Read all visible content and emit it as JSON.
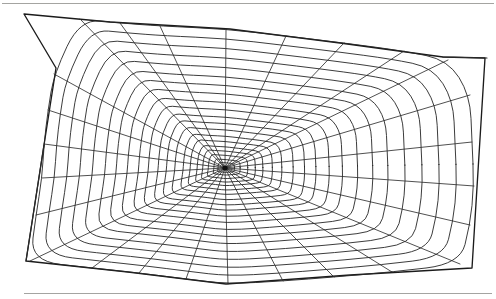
{
  "figure": {
    "caption": "",
    "background_color": "#ffffff",
    "line_color": "#222222",
    "rule_color": "#9a9a96"
  },
  "rules": [
    {
      "name": "top-rule",
      "y": 3.5,
      "x1": 2,
      "x2": 494
    },
    {
      "name": "bottom-rule",
      "y": 293.5,
      "x1": 24,
      "x2": 492
    }
  ],
  "chart_data": {
    "type": "scatter",
    "xlabel": "",
    "ylabel": "",
    "hub": {
      "x": 225,
      "y": 168
    },
    "frame_vertices": [
      {
        "x": 24,
        "y": 14
      },
      {
        "x": 110,
        "y": 22
      },
      {
        "x": 230,
        "y": 29
      },
      {
        "x": 340,
        "y": 43
      },
      {
        "x": 443,
        "y": 57
      },
      {
        "x": 485,
        "y": 58
      },
      {
        "x": 472,
        "y": 268
      },
      {
        "x": 350,
        "y": 275
      },
      {
        "x": 226,
        "y": 284
      },
      {
        "x": 128,
        "y": 272
      },
      {
        "x": 26,
        "y": 261
      },
      {
        "x": 44,
        "y": 145
      },
      {
        "x": 56,
        "y": 68
      }
    ],
    "radii_count": 26,
    "spiral_turns": 20,
    "radius_endpoints": [
      {
        "angle_deg": 0,
        "x": 474,
        "y": 186
      },
      {
        "angle_deg": 14,
        "x": 470,
        "y": 225
      },
      {
        "angle_deg": 28,
        "x": 460,
        "y": 264
      },
      {
        "angle_deg": 42,
        "x": 392,
        "y": 272
      },
      {
        "angle_deg": 56,
        "x": 334,
        "y": 277
      },
      {
        "angle_deg": 70,
        "x": 283,
        "y": 281
      },
      {
        "angle_deg": 84,
        "x": 228,
        "y": 284
      },
      {
        "angle_deg": 98,
        "x": 186,
        "y": 279
      },
      {
        "angle_deg": 112,
        "x": 139,
        "y": 273
      },
      {
        "angle_deg": 126,
        "x": 92,
        "y": 268
      },
      {
        "angle_deg": 140,
        "x": 30,
        "y": 261
      },
      {
        "angle_deg": 154,
        "x": 36,
        "y": 215
      },
      {
        "angle_deg": 168,
        "x": 42,
        "y": 178
      },
      {
        "angle_deg": 180,
        "x": 44,
        "y": 144
      },
      {
        "angle_deg": 194,
        "x": 48,
        "y": 110
      },
      {
        "angle_deg": 208,
        "x": 54,
        "y": 74
      },
      {
        "angle_deg": 222,
        "x": 80,
        "y": 19
      },
      {
        "angle_deg": 236,
        "x": 120,
        "y": 23
      },
      {
        "angle_deg": 250,
        "x": 160,
        "y": 26
      },
      {
        "angle_deg": 264,
        "x": 226,
        "y": 29
      },
      {
        "angle_deg": 278,
        "x": 286,
        "y": 36
      },
      {
        "angle_deg": 292,
        "x": 344,
        "y": 43
      },
      {
        "angle_deg": 306,
        "x": 404,
        "y": 51
      },
      {
        "angle_deg": 320,
        "x": 448,
        "y": 60
      },
      {
        "angle_deg": 334,
        "x": 470,
        "y": 95
      },
      {
        "angle_deg": 348,
        "x": 472,
        "y": 142
      }
    ],
    "spiral_radii_x": [
      7,
      12,
      17,
      23,
      29,
      36,
      44,
      52,
      61,
      70,
      80,
      91,
      103,
      115,
      128,
      142,
      157,
      172,
      188,
      205
    ],
    "spiral_radii_y": [
      5,
      8,
      12,
      16,
      20,
      25,
      30,
      36,
      42,
      48,
      55,
      62,
      70,
      78,
      86,
      95,
      104,
      113,
      122,
      131
    ],
    "legend": [],
    "grid": false
  }
}
